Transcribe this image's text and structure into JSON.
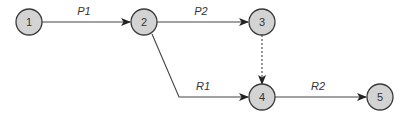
{
  "diagram": {
    "type": "network-flow",
    "colors": {
      "node_fill": "#d3d3d3",
      "node_stroke": "#3a3a3a",
      "edge": "#444444",
      "text": "#333333"
    },
    "nodes": [
      {
        "id": "1",
        "label": "1",
        "x": 29,
        "y": 22
      },
      {
        "id": "2",
        "label": "2",
        "x": 144,
        "y": 22
      },
      {
        "id": "3",
        "label": "3",
        "x": 262,
        "y": 22
      },
      {
        "id": "4",
        "label": "4",
        "x": 262,
        "y": 98
      },
      {
        "id": "5",
        "label": "5",
        "x": 380,
        "y": 98
      }
    ],
    "edges": [
      {
        "from": "1",
        "to": "2",
        "label": "P1",
        "style": "solid"
      },
      {
        "from": "2",
        "to": "3",
        "label": "P2",
        "style": "solid"
      },
      {
        "from": "3",
        "to": "4",
        "label": "",
        "style": "dashed"
      },
      {
        "from": "2",
        "to": "4",
        "label": "R1",
        "style": "solid",
        "bend": [
          179,
          97
        ]
      },
      {
        "from": "4",
        "to": "5",
        "label": "R2",
        "style": "solid"
      }
    ]
  }
}
